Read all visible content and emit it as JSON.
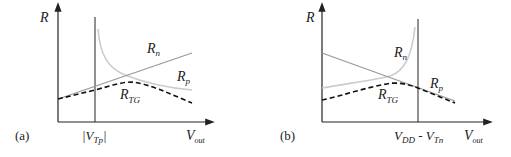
{
  "colors": {
    "axis": "#222222",
    "rn_line": "#999999",
    "rp_curve": "#cccccc",
    "rtg_dashed": "#111111"
  },
  "panels": [
    {
      "id": "a",
      "tag": "(a)",
      "y_axis_label": "R",
      "x_axis_label_main": "V",
      "x_axis_label_sub": "out",
      "marker_label_main": "|V",
      "marker_label_sub": "Tp",
      "marker_label_end": "|",
      "curves": [
        {
          "name": "Rn",
          "label_main": "R",
          "label_sub": "n",
          "style": "solid-line",
          "trend": "increasing linear"
        },
        {
          "name": "Rp",
          "label_main": "R",
          "label_sub": "p",
          "style": "light-curve",
          "trend": "decreasing from asymptote at |VTp|"
        },
        {
          "name": "RTG",
          "label_main": "R",
          "label_sub": "TG",
          "style": "dashed",
          "trend": "rises then falls"
        }
      ]
    },
    {
      "id": "b",
      "tag": "(b)",
      "y_axis_label": "R",
      "x_axis_label_main": "V",
      "x_axis_label_sub": "out",
      "marker_label_main": "V",
      "marker_label_sub1": "DD",
      "marker_label_mid": " - V",
      "marker_label_sub2": "Tn",
      "curves": [
        {
          "name": "Rn",
          "label_main": "R",
          "label_sub": "n",
          "style": "light-curve",
          "trend": "increasing to asymptote at VDD-VTn"
        },
        {
          "name": "Rp",
          "label_main": "R",
          "label_sub": "p",
          "style": "solid-line",
          "trend": "decreasing linear"
        },
        {
          "name": "RTG",
          "label_main": "R",
          "label_sub": "TG",
          "style": "dashed",
          "trend": "rises then falls"
        }
      ]
    }
  ]
}
